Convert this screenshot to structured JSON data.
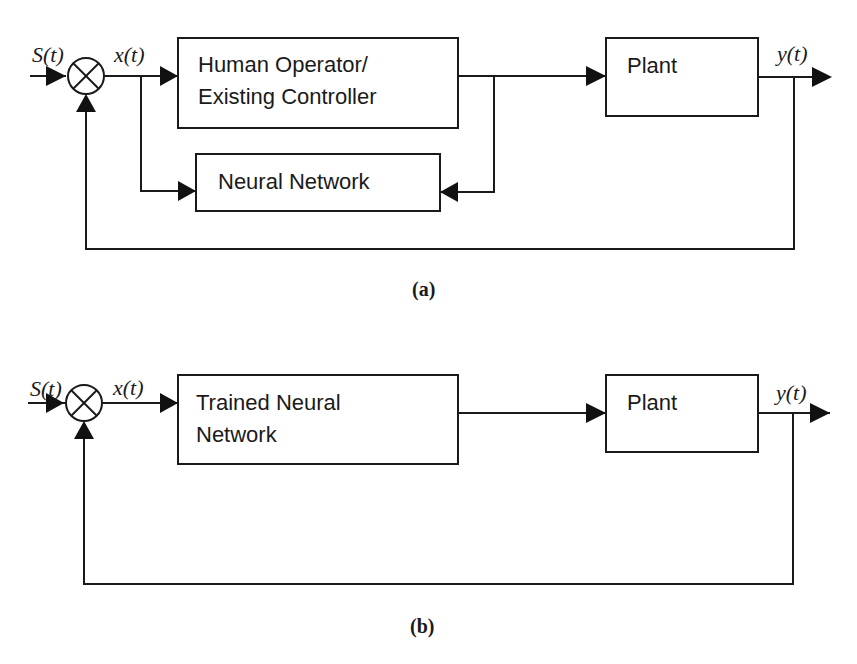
{
  "diagram_a": {
    "caption": "(a)",
    "input_signal": "S(t)",
    "error_signal": "x(t)",
    "output_signal": "y(t)",
    "blocks": {
      "controller_line1": "Human Operator/",
      "controller_line2": "Existing Controller",
      "neural_network": "Neural Network",
      "plant": "Plant"
    }
  },
  "diagram_b": {
    "caption": "(b)",
    "input_signal": "S(t)",
    "error_signal": "x(t)",
    "output_signal": "y(t)",
    "blocks": {
      "trained_nn_line1": "Trained Neural",
      "trained_nn_line2": "Network",
      "plant": "Plant"
    }
  },
  "icons": {
    "summing_junction": "circle-with-x",
    "arrowhead": "filled-triangle"
  }
}
